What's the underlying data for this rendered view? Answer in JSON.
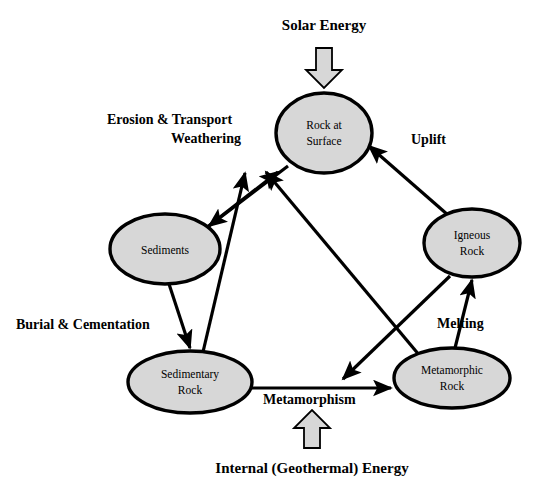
{
  "diagram": {
    "colors": {
      "node_fill": "#d7d7d7",
      "node_stroke": "#000000",
      "edge": "#000000",
      "block_arrow_fill": "#d7d7d7",
      "background": "#ffffff",
      "text": "#000000"
    },
    "nodes": [
      {
        "id": "rock-at-surface",
        "lines": [
          "Rock at",
          "Surface"
        ],
        "cx": 324,
        "cy": 133,
        "rx": 48,
        "ry": 40
      },
      {
        "id": "sediments",
        "lines": [
          "Sediments"
        ],
        "cx": 165,
        "cy": 249,
        "rx": 55,
        "ry": 35
      },
      {
        "id": "igneous-rock",
        "lines": [
          "Igneous",
          "Rock"
        ],
        "cx": 472,
        "cy": 243,
        "rx": 48,
        "ry": 34
      },
      {
        "id": "sedimentary-rock",
        "lines": [
          "Sedimentary",
          "Rock"
        ],
        "cx": 190,
        "cy": 382,
        "rx": 62,
        "ry": 31
      },
      {
        "id": "metamorphic-rock",
        "lines": [
          "Metamorphic",
          "Rock"
        ],
        "cx": 452,
        "cy": 378,
        "rx": 58,
        "ry": 30
      }
    ],
    "edges": [
      {
        "id": "surface-to-sediments",
        "from": "rock-at-surface",
        "to": "sediments",
        "label": "Erosion & Transport Weathering"
      },
      {
        "id": "sediments-to-surface",
        "from": "sediments",
        "to": "rock-at-surface",
        "label": ""
      },
      {
        "id": "sedimentary-to-surface",
        "from": "sedimentary-rock",
        "to": "rock-at-surface",
        "label": ""
      },
      {
        "id": "metamorphic-to-surface",
        "from": "metamorphic-rock",
        "to": "rock-at-surface",
        "label": ""
      },
      {
        "id": "igneous-to-surface",
        "from": "igneous-rock",
        "to": "rock-at-surface",
        "label": "Uplift"
      },
      {
        "id": "sediments-to-sedimentary",
        "from": "sediments",
        "to": "sedimentary-rock",
        "label": "Burial & Cementation"
      },
      {
        "id": "sedimentary-to-metamorphic",
        "from": "sedimentary-rock",
        "to": "metamorphic-rock",
        "label": "Metamorphism"
      },
      {
        "id": "igneous-to-metamorphic",
        "from": "igneous-rock",
        "to": "metamorphic-rock",
        "label": ""
      },
      {
        "id": "metamorphic-to-igneous",
        "from": "metamorphic-rock",
        "to": "igneous-rock",
        "label": "Melting"
      }
    ],
    "edge_labels": {
      "erosion_line1": "Erosion & Transport",
      "erosion_line2": "Weathering",
      "uplift": "Uplift",
      "burial": "Burial & Cementation",
      "melting": "Melting",
      "metamorphism": "Metamorphism"
    },
    "energy_inputs": [
      {
        "id": "solar-energy",
        "label": "Solar Energy",
        "direction": "down",
        "label_x": 324,
        "label_y": 30
      },
      {
        "id": "internal-geothermal-energy",
        "label": "Internal (Geothermal) Energy",
        "direction": "up",
        "label_x": 312,
        "label_y": 473
      }
    ]
  }
}
